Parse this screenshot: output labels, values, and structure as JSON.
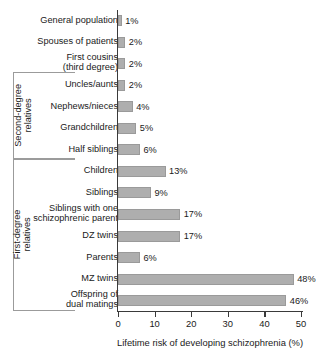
{
  "chart_data": {
    "type": "bar",
    "orientation": "horizontal",
    "title": "",
    "xlabel": "Lifetime risk of developing schizophrenia (%)",
    "ylabel": "",
    "xlim": [
      0,
      52
    ],
    "grid": false,
    "legend": null,
    "xticks": [
      0,
      10,
      20,
      30,
      40,
      50
    ],
    "xticklabels": [
      "0",
      "10",
      "20",
      "30",
      "40",
      "50"
    ],
    "categories": [
      "General population",
      "Spouses of patients",
      "First cousins\n(third degree)",
      "Uncles/aunts",
      "Nephews/nieces",
      "Grandchildren",
      "Half siblings",
      "Children",
      "Siblings",
      "Siblings with one\nschizophrenic parent",
      "DZ twins",
      "Parents",
      "MZ twins",
      "Offspring of\ndual matings"
    ],
    "values": [
      1,
      2,
      2,
      2,
      4,
      5,
      6,
      13,
      9,
      17,
      17,
      6,
      48,
      46
    ],
    "value_labels": [
      "1%",
      "2%",
      "2%",
      "2%",
      "4%",
      "5%",
      "6%",
      "13%",
      "9%",
      "17%",
      "17%",
      "6%",
      "48%",
      "46%"
    ],
    "bar_color": "#aeaeae",
    "bar_edge_color": "#9a9a9a",
    "axis_color": "#3a3a3a",
    "bracket_color": "#9b9b9b",
    "groups": [
      {
        "label": "Second-degree\nrelatives",
        "first_index": 3,
        "last_index": 6
      },
      {
        "label": "First-degree\nrelatives",
        "first_index": 7,
        "last_index": 13
      }
    ]
  }
}
